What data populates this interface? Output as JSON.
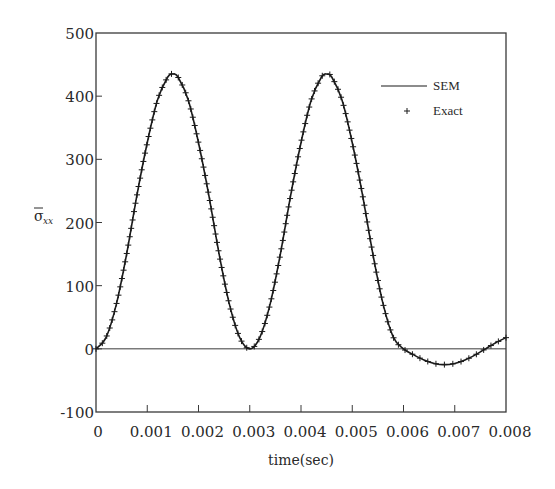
{
  "chart_data": {
    "type": "line",
    "title": "",
    "xlabel": "time(sec)",
    "ylabel": "σ̄xx",
    "ylabel_main": "σ",
    "ylabel_sub": "xx",
    "xlim": [
      0,
      0.008
    ],
    "ylim": [
      -100,
      500
    ],
    "grid": false,
    "legend_position": "upper right (inside)",
    "x_ticks": [
      0,
      0.001,
      0.002,
      0.003,
      0.004,
      0.005,
      0.006,
      0.007,
      0.008
    ],
    "x_tick_labels": [
      "0",
      "0.001",
      "0.002",
      "0.003",
      "0.004",
      "0.005",
      "0.006",
      "0.007",
      "0.008"
    ],
    "y_ticks": [
      -100,
      0,
      100,
      200,
      300,
      400,
      500
    ],
    "y_tick_labels": [
      "-100",
      "0",
      "100",
      "200",
      "300",
      "400",
      "500"
    ],
    "zero_line": true,
    "x": [
      0,
      0.0002,
      0.0004,
      0.0006,
      0.0008,
      0.001,
      0.0012,
      0.0014,
      0.0015,
      0.0016,
      0.0018,
      0.002,
      0.0022,
      0.0024,
      0.0026,
      0.0028,
      0.003,
      0.0032,
      0.0034,
      0.0036,
      0.0038,
      0.004,
      0.0042,
      0.0044,
      0.0045,
      0.0046,
      0.0048,
      0.005,
      0.0052,
      0.0054,
      0.0056,
      0.0058,
      0.006,
      0.0062,
      0.0064,
      0.0066,
      0.0068,
      0.007,
      0.0072,
      0.0074,
      0.0076,
      0.0078,
      0.008
    ],
    "series": [
      {
        "name": "SEM",
        "style": "solid line",
        "color": "#1a1a1a",
        "values": [
          0,
          18.6,
          71.5,
          151,
          243.8,
          326.3,
          393.8,
          430.3,
          435,
          430.3,
          393.8,
          326.3,
          243.8,
          151,
          71.5,
          18.6,
          0,
          18.6,
          71.5,
          151,
          243.8,
          326.3,
          393.8,
          430.3,
          435,
          430.3,
          393.8,
          326.3,
          243.8,
          151,
          71.5,
          18.6,
          0,
          -9.6,
          -17.7,
          -23.1,
          -25,
          -23.1,
          -17.7,
          -9.6,
          0,
          9.6,
          17.7
        ]
      },
      {
        "name": "Exact",
        "style": "plus markers",
        "color": "#1a1a1a",
        "values": [
          0,
          18.6,
          71.5,
          151,
          243.8,
          326.3,
          393.8,
          430.3,
          435,
          430.3,
          393.8,
          326.3,
          243.8,
          151,
          71.5,
          18.6,
          0,
          18.6,
          71.5,
          151,
          243.8,
          326.3,
          393.8,
          430.3,
          435,
          430.3,
          393.8,
          326.3,
          243.8,
          151,
          71.5,
          18.6,
          0,
          -9.6,
          -17.7,
          -23.1,
          -25,
          -23.1,
          -17.7,
          -9.6,
          0,
          9.6,
          17.7
        ]
      }
    ],
    "annotations": {
      "peak_value_approx": 435,
      "peak_times": [
        0.0015,
        0.0045
      ],
      "min_after_0006_approx": -25
    }
  },
  "legend": {
    "items": [
      {
        "label": "SEM",
        "symbol": "line"
      },
      {
        "label": "Exact",
        "symbol": "+"
      }
    ]
  },
  "colors": {
    "axis": "#3a3a3a",
    "curve": "#1a1a1a",
    "background": "#ffffff"
  }
}
